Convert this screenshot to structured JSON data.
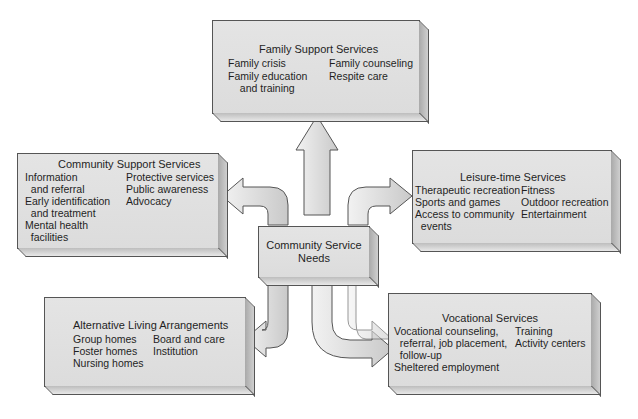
{
  "diagram": {
    "center": {
      "line1": "Community Service",
      "line2": "Needs"
    },
    "family_support": {
      "title": "Family Support Services",
      "left": [
        "Family crisis",
        "Family education",
        "  and training"
      ],
      "right": [
        "Family counseling",
        "Respite care"
      ]
    },
    "community_support": {
      "title": "Community Support Services",
      "left": [
        "Information",
        "  and referral",
        "Early identification",
        "  and treatment",
        "Mental health",
        "  facilities"
      ],
      "right": [
        "Protective services",
        "Public awareness",
        "Advocacy"
      ]
    },
    "leisure": {
      "title": "Leisure-time Services",
      "left": [
        "Therapeutic recreation",
        "Sports and games",
        "Access to community",
        "  events"
      ],
      "right": [
        "Fitness",
        "Outdoor recreation",
        "Entertainment"
      ]
    },
    "alternative_living": {
      "title": "Alternative Living Arrangements",
      "left": [
        "Group homes",
        "Foster homes",
        "Nursing homes"
      ],
      "right": [
        "Board and care",
        "Institution"
      ]
    },
    "vocational": {
      "title": "Vocational Services",
      "left": [
        "Vocational counseling,",
        "  referral, job placement,",
        "  follow-up",
        "Sheltered employment"
      ],
      "right": [
        "Training",
        "Activity centers"
      ]
    },
    "colors": {
      "box_fill": "#e0e0e0",
      "stroke": "#555555",
      "arrow_fill": "#ececec"
    }
  }
}
